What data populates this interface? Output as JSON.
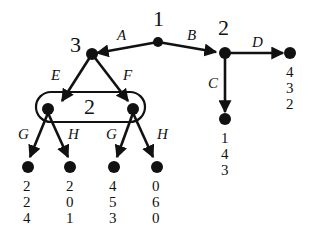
{
  "diagram": {
    "type": "extensive-form game tree",
    "root": {
      "player": "1"
    },
    "player_labels": {
      "root": "1",
      "left": "3",
      "right": "2",
      "info_set": "2"
    },
    "actions": {
      "A": "A",
      "B": "B",
      "C": "C",
      "D": "D",
      "E": "E",
      "F": "F",
      "G1": "G",
      "H1": "H",
      "G2": "G",
      "H2": "H"
    },
    "payoffs": {
      "D": [
        "4",
        "3",
        "2"
      ],
      "C": [
        "1",
        "4",
        "3"
      ],
      "EG": [
        "2",
        "2",
        "4"
      ],
      "EH": [
        "2",
        "0",
        "1"
      ],
      "FG": [
        "4",
        "5",
        "3"
      ],
      "FH": [
        "0",
        "6",
        "0"
      ]
    }
  }
}
